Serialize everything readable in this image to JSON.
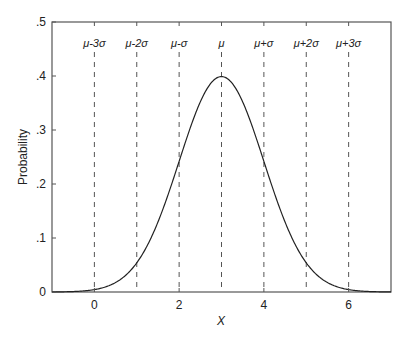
{
  "chart_data": {
    "type": "line",
    "title": "",
    "xlabel": "X",
    "ylabel": "Probability",
    "xlim": [
      -1,
      7
    ],
    "ylim": [
      0,
      0.5
    ],
    "grid": false,
    "legend": null,
    "x_ticks": [
      0,
      2,
      4,
      6
    ],
    "x_tick_labels": [
      "0",
      "2",
      "4",
      "6"
    ],
    "y_ticks": [
      0,
      0.1,
      0.2,
      0.3,
      0.4,
      0.5
    ],
    "y_tick_labels": [
      "0",
      ".1",
      ".2",
      ".3",
      ".4",
      ".5"
    ],
    "series": [
      {
        "name": "Normal PDF",
        "distribution": "normal",
        "mean": 3,
        "sd": 1,
        "x": [
          -1,
          -0.5,
          0,
          0.5,
          1,
          1.5,
          2,
          2.5,
          3,
          3.5,
          4,
          4.5,
          5,
          5.5,
          6,
          6.5,
          7
        ],
        "y": [
          0.0001,
          0.0009,
          0.0044,
          0.0175,
          0.054,
          0.1295,
          0.242,
          0.3521,
          0.3989,
          0.3521,
          0.242,
          0.1295,
          0.054,
          0.0175,
          0.0044,
          0.0009,
          0.0001
        ]
      }
    ],
    "annotations": [
      {
        "label": "μ-3σ",
        "x": 0
      },
      {
        "label": "μ-2σ",
        "x": 1
      },
      {
        "label": "μ-σ",
        "x": 2
      },
      {
        "label": "μ",
        "x": 3
      },
      {
        "label": "μ+σ",
        "x": 4
      },
      {
        "label": "μ+2σ",
        "x": 5
      },
      {
        "label": "μ+3σ",
        "x": 6
      }
    ],
    "reference_lines": {
      "style": "dashed",
      "orientation": "vertical",
      "x": [
        0,
        1,
        2,
        3,
        4,
        5,
        6
      ]
    }
  },
  "colors": {
    "axis": "#555555",
    "curve": "#222222",
    "dashed": "#555555",
    "text": "#222222"
  }
}
